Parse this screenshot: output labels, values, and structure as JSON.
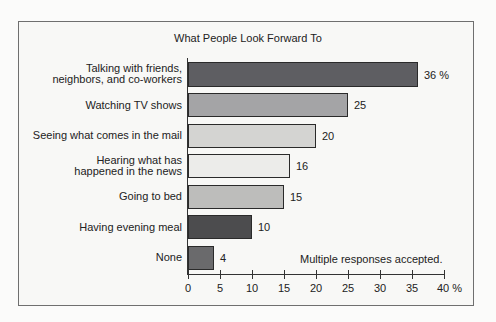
{
  "chart_data": {
    "type": "bar",
    "orientation": "horizontal",
    "title": "What People Look Forward To",
    "categories": [
      "Talking with friends, neighbors, and co-workers",
      "Watching TV shows",
      "Seeing what comes in the mail",
      "Hearing what has happened in the news",
      "Going to bed",
      "Having evening meal",
      "None"
    ],
    "values": [
      36,
      25,
      20,
      16,
      15,
      10,
      4
    ],
    "value_labels": [
      "36 %",
      "25",
      "20",
      "16",
      "15",
      "10",
      "4"
    ],
    "bar_colors": [
      "#5e5e62",
      "#a4a4a6",
      "#d4d4d2",
      "#ececea",
      "#bdbdbb",
      "#4c4c4e",
      "#6a6a6c"
    ],
    "xlabel": "",
    "ylabel": "",
    "xlim": [
      0,
      40
    ],
    "xticks": [
      "0",
      "5",
      "10",
      "15",
      "20",
      "25",
      "30",
      "35",
      "40 %"
    ],
    "grid": false,
    "annotation": "Multiple responses accepted."
  },
  "labels": {
    "cat0_line1": "Talking with friends,",
    "cat0_line2": "neighbors, and co-workers",
    "cat3_line1": "Hearing what has",
    "cat3_line2": "happened in the news"
  }
}
